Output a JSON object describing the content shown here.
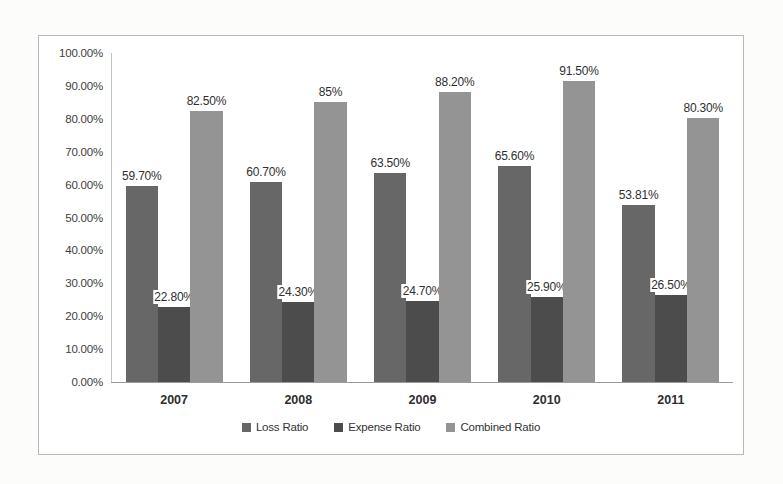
{
  "chart_data": {
    "type": "bar",
    "title": "",
    "subtitle": "",
    "xlabel": "",
    "ylabel": "",
    "categories": [
      "2007",
      "2008",
      "2009",
      "2010",
      "2011"
    ],
    "series": [
      {
        "name": "Loss Ratio",
        "color": "#676767",
        "values": [
          59.7,
          60.7,
          63.5,
          65.6,
          53.81
        ],
        "labels": [
          "59.70%",
          "60.70%",
          "63.50%",
          "65.60%",
          "53.81%"
        ]
      },
      {
        "name": "Expense Ratio",
        "color": "#4c4c4c",
        "values": [
          22.8,
          24.3,
          24.7,
          25.9,
          26.5
        ],
        "labels": [
          "22.80%",
          "24.30%",
          "24.70%",
          "25.90%",
          "26.50%"
        ]
      },
      {
        "name": "Combined Ratio",
        "color": "#949494",
        "values": [
          82.5,
          85.0,
          88.2,
          91.5,
          80.3
        ],
        "labels": [
          "82.50%",
          "85%",
          "88.20%",
          "91.50%",
          "80.30%"
        ]
      }
    ],
    "ylim": [
      0,
      100
    ],
    "ytick_values": [
      0,
      10,
      20,
      30,
      40,
      50,
      60,
      70,
      80,
      90,
      100
    ],
    "ytick_labels": [
      "0.00%",
      "10.00%",
      "20.00%",
      "30.00%",
      "40.00%",
      "50.00%",
      "60.00%",
      "70.00%",
      "80.00%",
      "90.00%",
      "100.00%"
    ],
    "grid": false,
    "legend_position": "bottom",
    "data_labels_shown": true
  }
}
